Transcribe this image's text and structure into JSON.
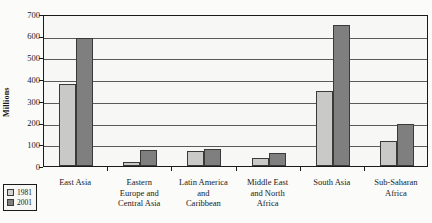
{
  "chart_data": {
    "type": "bar",
    "title": "",
    "xlabel": "",
    "ylabel": "Millions",
    "ylim": [
      0,
      700
    ],
    "ytick_values": [
      0,
      100,
      200,
      300,
      400,
      500,
      600,
      700
    ],
    "ytick_labels": [
      "0",
      "100",
      "200",
      "300",
      "400",
      "500",
      "600",
      "700"
    ],
    "grid": true,
    "legend_position": "bottom-left",
    "categories": [
      "East Asia",
      "Eastern Europe and Central Asia",
      "Latin America and Caribbean",
      "Middle East and North Africa",
      "South Asia",
      "Sub-Saharan Africa"
    ],
    "category_lines": [
      [
        "East Asia"
      ],
      [
        "Eastern",
        "Europe and",
        "Central Asia"
      ],
      [
        "Latin America",
        "and",
        "Caribbean"
      ],
      [
        "Middle East",
        "and North",
        "Africa"
      ],
      [
        "South Asia"
      ],
      [
        "Sub-Saharan",
        "Africa"
      ]
    ],
    "series": [
      {
        "name": "1981",
        "color": "#c9c9c7",
        "values": [
          380,
          20,
          70,
          35,
          345,
          115
        ]
      },
      {
        "name": "2001",
        "color": "#7f7f7f",
        "values": [
          590,
          75,
          80,
          60,
          650,
          195
        ]
      }
    ]
  },
  "legend": {
    "items": [
      {
        "label": "1981",
        "swatch": "s1981"
      },
      {
        "label": "2001",
        "swatch": "s2001"
      }
    ]
  },
  "source_note": ""
}
